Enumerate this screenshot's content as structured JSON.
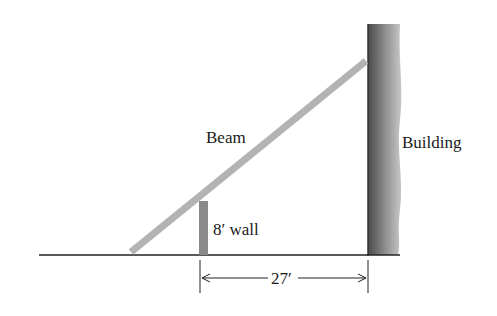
{
  "diagram": {
    "labels": {
      "beam": "Beam",
      "building": "Building",
      "wall": "8′ wall",
      "distance": "27′"
    },
    "dimensions": {
      "wall_height_ft": 8,
      "wall_to_building_ft": 27
    },
    "colors": {
      "beam": "#b3b3b3",
      "wall": "#8a8a8a",
      "building_dark": "#555555",
      "building_light": "#c8c8c8",
      "line": "#222222"
    }
  }
}
